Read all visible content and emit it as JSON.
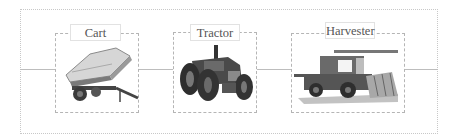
{
  "diagram": {
    "title": "",
    "nodes": [
      {
        "id": "cart",
        "label": "Cart",
        "icon": "cart-trailer-image"
      },
      {
        "id": "tractor",
        "label": "Tractor",
        "icon": "tractor-image"
      },
      {
        "id": "harvester",
        "label": "Harvester",
        "icon": "harvester-image"
      }
    ],
    "edges": [
      {
        "from": "left-edge",
        "to": "cart"
      },
      {
        "from": "cart",
        "to": "tractor"
      },
      {
        "from": "tractor",
        "to": "harvester"
      },
      {
        "from": "harvester",
        "to": "right-edge"
      }
    ],
    "colors": {
      "line": "#bdbdbd",
      "border": "#b5b5b5",
      "text": "#555555",
      "vehicle_dark": "#3a3a3a",
      "vehicle_mid": "#6a6a6a",
      "vehicle_light": "#d0d0d0"
    }
  }
}
